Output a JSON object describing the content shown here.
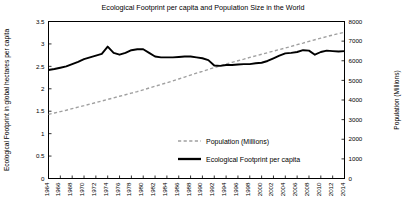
{
  "chart_data": {
    "type": "line",
    "title": "Ecological Footprint per capita and Population Size in the World",
    "xlabel": "",
    "ylabel": "Ecological Footprint in global hectares per capita",
    "y2label": "Population (Millions)",
    "grid": false,
    "legend_position": "inside-center-right",
    "xlim": [
      1964,
      2014
    ],
    "ylim": [
      0,
      3.5
    ],
    "y2lim": [
      0,
      8000
    ],
    "yticks": [
      0,
      0.5,
      1,
      1.5,
      2,
      2.5,
      3,
      3.5
    ],
    "ytick_labels": [
      "0",
      "0.5",
      "1",
      "1.5",
      "2",
      "2.5",
      "3",
      "3.5"
    ],
    "y2ticks": [
      0,
      1000,
      2000,
      3000,
      4000,
      5000,
      6000,
      7000,
      8000
    ],
    "y2tick_labels": [
      "0",
      "1000",
      "2000",
      "3000",
      "4000",
      "5000",
      "6000",
      "7000",
      "8000"
    ],
    "xticks": [
      1964,
      1966,
      1968,
      1970,
      1972,
      1974,
      1976,
      1978,
      1980,
      1982,
      1984,
      1986,
      1988,
      1990,
      1992,
      1994,
      1996,
      1998,
      2000,
      2002,
      2004,
      2006,
      2008,
      2010,
      2012,
      2014
    ],
    "xtick_labels": [
      "1964",
      "1966",
      "1968",
      "1970",
      "1972",
      "1974",
      "1976",
      "1978",
      "1980",
      "1982",
      "1984",
      "1986",
      "1988",
      "1990",
      "1992",
      "1994",
      "1996",
      "1998",
      "2000",
      "2002",
      "2004",
      "2006",
      "2008",
      "2010",
      "2012",
      "2014"
    ],
    "x": [
      1964,
      1965,
      1966,
      1967,
      1968,
      1969,
      1970,
      1971,
      1972,
      1973,
      1974,
      1975,
      1976,
      1977,
      1978,
      1979,
      1980,
      1981,
      1982,
      1983,
      1984,
      1985,
      1986,
      1987,
      1988,
      1989,
      1990,
      1991,
      1992,
      1993,
      1994,
      1995,
      1996,
      1997,
      1998,
      1999,
      2000,
      2001,
      2002,
      2003,
      2004,
      2005,
      2006,
      2007,
      2008,
      2009,
      2010,
      2011,
      2012,
      2013,
      2014
    ],
    "series": [
      {
        "name": "Population (Millions)",
        "axis": "right",
        "style": "dashed",
        "color": "#a0a0a0",
        "values": [
          3270,
          3340,
          3410,
          3480,
          3560,
          3640,
          3710,
          3790,
          3870,
          3950,
          4030,
          4110,
          4190,
          4270,
          4350,
          4430,
          4520,
          4610,
          4700,
          4790,
          4880,
          4970,
          5070,
          5170,
          5270,
          5370,
          5460,
          5560,
          5650,
          5740,
          5830,
          5920,
          6000,
          6080,
          6170,
          6250,
          6330,
          6410,
          6490,
          6570,
          6650,
          6730,
          6820,
          6900,
          6990,
          7070,
          7150,
          7230,
          7310,
          7380,
          7450
        ]
      },
      {
        "name": "Ecological Footprint per capita",
        "axis": "left",
        "style": "solid",
        "color": "#000000",
        "values": [
          2.42,
          2.44,
          2.47,
          2.5,
          2.55,
          2.6,
          2.66,
          2.7,
          2.74,
          2.78,
          2.94,
          2.8,
          2.76,
          2.8,
          2.86,
          2.88,
          2.88,
          2.8,
          2.72,
          2.7,
          2.7,
          2.7,
          2.71,
          2.72,
          2.72,
          2.7,
          2.68,
          2.64,
          2.52,
          2.51,
          2.53,
          2.53,
          2.54,
          2.55,
          2.55,
          2.57,
          2.58,
          2.62,
          2.68,
          2.74,
          2.79,
          2.8,
          2.82,
          2.86,
          2.85,
          2.76,
          2.82,
          2.85,
          2.84,
          2.83,
          2.84
        ]
      }
    ]
  },
  "legend": {
    "items": [
      {
        "label": "Population (Millions)"
      },
      {
        "label": "Ecological Footprint per capita"
      }
    ]
  }
}
